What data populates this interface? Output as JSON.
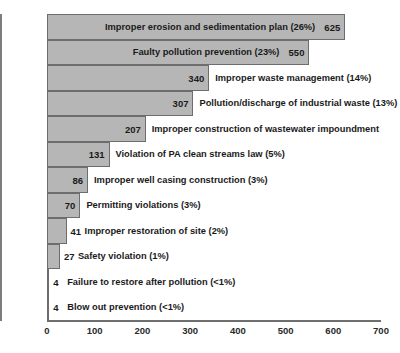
{
  "chart_data": {
    "type": "bar",
    "orientation": "horizontal",
    "title": "",
    "xlabel": "",
    "ylabel": "",
    "xlim": [
      0,
      700
    ],
    "xticks": [
      0,
      100,
      200,
      300,
      400,
      500,
      600,
      700
    ],
    "grid": false,
    "legend": null,
    "categories": [
      "Improper erosion and sedimentation plan",
      "Faulty pollution prevention",
      "Improper waste management",
      "Pollution/discharge of industrial waste",
      "Improper construction of wastewater impoundment",
      "Violation of PA clean streams law",
      "Improper well casing construction",
      "Permitting violations",
      "Improper restoration of site",
      "Safety violation",
      "Failure to restore after pollution",
      "Blow out prevention"
    ],
    "values": [
      625,
      550,
      340,
      307,
      207,
      131,
      86,
      70,
      41,
      27,
      4,
      4
    ],
    "percent_labels": [
      "(26%)",
      "(23%)",
      "(14%)",
      "(13%)",
      "",
      "(5%)",
      "(3%)",
      "(3%)",
      "(2%)",
      "(1%)",
      "(<1%)",
      "(<1%)"
    ],
    "bars": [
      {
        "label": "Improper erosion and sedimentation plan (26%)",
        "value": 625,
        "value_text": "625",
        "label_inside": true
      },
      {
        "label": "Faulty pollution prevention (23%)",
        "value": 550,
        "value_text": "550",
        "label_inside": true
      },
      {
        "label": "Improper waste management (14%)",
        "value": 340,
        "value_text": "340",
        "label_inside": false
      },
      {
        "label": "Pollution/discharge of industrial waste (13%)",
        "value": 307,
        "value_text": "307",
        "label_inside": false
      },
      {
        "label": "Improper construction of wastewater impoundment",
        "value": 207,
        "value_text": "207",
        "label_inside": false
      },
      {
        "label": "Violation of PA clean streams law (5%)",
        "value": 131,
        "value_text": "131",
        "label_inside": false
      },
      {
        "label": "Improper well casing construction (3%)",
        "value": 86,
        "value_text": "86",
        "label_inside": false
      },
      {
        "label": "Permitting violations (3%)",
        "value": 70,
        "value_text": "70",
        "label_inside": false
      },
      {
        "label": "Improper restoration of site (2%)",
        "value": 41,
        "value_text": "41",
        "label_inside": false
      },
      {
        "label": "Safety violation (1%)",
        "value": 27,
        "value_text": "27",
        "label_inside": false
      },
      {
        "label": "Failure to restore after pollution (<1%)",
        "value": 4,
        "value_text": "4",
        "label_inside": false
      },
      {
        "label": "Blow out prevention (<1%)",
        "value": 4,
        "value_text": "4",
        "label_inside": false
      }
    ],
    "colors": {
      "bar_fill": "#b6b6b6",
      "bar_border": "#6d6d6d",
      "text": "#1a1a1a",
      "axis": "#6f6f6f",
      "background": "#ffffff"
    }
  }
}
